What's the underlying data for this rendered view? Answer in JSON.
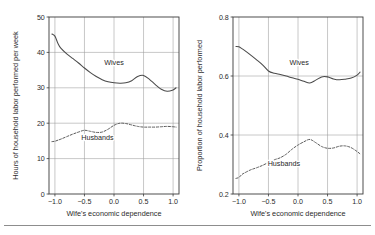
{
  "figure": {
    "background": "#ffffff",
    "axis_color": "#3a3a3a",
    "grid_color": "#9a9a9a",
    "curve_color": "#4a4a4a",
    "has_bottom_rule": true
  },
  "chart_data": [
    {
      "panel": "left",
      "type": "line",
      "title": "",
      "xlabel": "Wife's economic dependence",
      "ylabel": "Hours of household labor performed per week",
      "xlim": [
        -1.1,
        1.1
      ],
      "ylim": [
        0,
        50
      ],
      "xticks": [
        -1.0,
        -0.5,
        0.0,
        0.5,
        1.0
      ],
      "xticklabels": [
        "−1.0",
        "−0.5",
        "0.0",
        "0.5",
        "1.0"
      ],
      "yticks": [
        0,
        10,
        20,
        30,
        40,
        50
      ],
      "yticklabels": [
        "0",
        "10",
        "20",
        "30",
        "40",
        "50"
      ],
      "grid": "both",
      "legend": "inline-annotation",
      "x": [
        -1.05,
        -1.0,
        -0.95,
        -0.9,
        -0.8,
        -0.7,
        -0.6,
        -0.5,
        -0.4,
        -0.3,
        -0.2,
        -0.1,
        0.0,
        0.1,
        0.2,
        0.3,
        0.4,
        0.5,
        0.6,
        0.7,
        0.8,
        0.9,
        1.0,
        1.05
      ],
      "series": [
        {
          "name": "Wives",
          "style": "solid",
          "label_x": 0.0,
          "label_y": 36.5,
          "values": [
            45.2,
            44.6,
            42.6,
            41.2,
            39.6,
            38.3,
            37.0,
            35.6,
            34.3,
            33.2,
            32.3,
            31.7,
            31.4,
            31.3,
            31.4,
            32.0,
            33.2,
            33.5,
            32.4,
            30.9,
            29.6,
            29.0,
            29.4,
            30.0
          ]
        },
        {
          "name": "Husbands",
          "style": "dashed",
          "label_x": -0.28,
          "label_y": 15.2,
          "values": [
            14.8,
            14.9,
            15.2,
            15.5,
            16.2,
            16.9,
            17.5,
            18.0,
            17.7,
            17.4,
            17.5,
            18.3,
            19.4,
            20.0,
            19.9,
            19.5,
            19.1,
            18.9,
            18.9,
            18.9,
            19.0,
            19.1,
            19.0,
            18.9
          ]
        }
      ]
    },
    {
      "panel": "right",
      "type": "line",
      "title": "",
      "xlabel": "Wife's economic dependence",
      "ylabel": "Proportion of household labor performed",
      "xlim": [
        -1.1,
        1.1
      ],
      "ylim": [
        0.2,
        0.8
      ],
      "xticks": [
        -1.0,
        -0.5,
        0.0,
        0.5,
        1.0
      ],
      "xticklabels": [
        "−1.0",
        "−0.5",
        "0.0",
        "0.5",
        "1.0"
      ],
      "yticks": [
        0.2,
        0.4,
        0.6,
        0.8
      ],
      "yticklabels": [
        "0.2",
        "0.4",
        "0.6",
        "0.8"
      ],
      "grid": "both",
      "legend": "inline-annotation",
      "x": [
        -1.05,
        -1.0,
        -0.95,
        -0.9,
        -0.8,
        -0.7,
        -0.6,
        -0.5,
        -0.4,
        -0.3,
        -0.2,
        -0.1,
        0.0,
        0.1,
        0.2,
        0.3,
        0.4,
        0.5,
        0.6,
        0.7,
        0.8,
        0.9,
        1.0,
        1.05
      ],
      "series": [
        {
          "name": "Wives",
          "style": "solid",
          "label_x": 0.02,
          "label_y": 0.638,
          "values": [
            0.7,
            0.699,
            0.693,
            0.686,
            0.671,
            0.655,
            0.638,
            0.617,
            0.609,
            0.605,
            0.6,
            0.594,
            0.589,
            0.582,
            0.576,
            0.586,
            0.597,
            0.597,
            0.59,
            0.587,
            0.589,
            0.593,
            0.603,
            0.613
          ]
        },
        {
          "name": "Husbands",
          "style": "dashed",
          "label_x": -0.24,
          "label_y": 0.296,
          "values": [
            0.253,
            0.256,
            0.266,
            0.272,
            0.282,
            0.289,
            0.297,
            0.307,
            0.316,
            0.323,
            0.335,
            0.352,
            0.366,
            0.377,
            0.385,
            0.374,
            0.361,
            0.355,
            0.356,
            0.362,
            0.363,
            0.357,
            0.344,
            0.336
          ]
        }
      ]
    }
  ]
}
